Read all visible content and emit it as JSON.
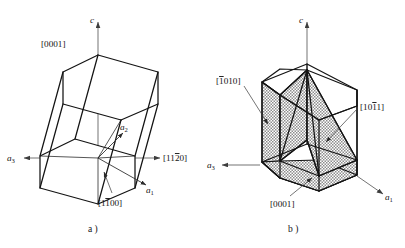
{
  "figure": {
    "background_color": "#ffffff",
    "line_color": "#141414",
    "axis_color": "#5a5a5a",
    "shade_fill": "#b9b9b9"
  },
  "panels": [
    {
      "id": "a",
      "caption": "a )",
      "description": "Hexagonal prism outline with crystallographic axes and direction labels",
      "axes": [
        {
          "name": "c-axis",
          "label": "c",
          "italic": true,
          "arrow": "up"
        },
        {
          "name": "a1-axis",
          "label": "a",
          "subscript": "1",
          "italic": true,
          "arrow": "down-right"
        },
        {
          "name": "a2-axis",
          "label": "a",
          "subscript": "2",
          "italic": true,
          "arrow": "up-right"
        },
        {
          "name": "a3-axis",
          "label": "a",
          "subscript": "3",
          "italic": true,
          "arrow": "right"
        }
      ],
      "direction_labels": [
        {
          "name": "direction-0001",
          "open": "[",
          "digits": "0001",
          "overbars": [],
          "close": "]",
          "text": "[0001]"
        },
        {
          "name": "direction-11-20",
          "open": "[",
          "digits": "1120",
          "overbars": [
            2
          ],
          "close": "]",
          "text": "[1120]"
        },
        {
          "name": "direction-1-100",
          "open": "[",
          "digits": "1100",
          "overbars": [
            1
          ],
          "close": "]",
          "text": "[1100]"
        }
      ]
    },
    {
      "id": "b",
      "caption": "b )",
      "description": "Hexagonal prism with three shaded crystallographic planes",
      "axes": [
        {
          "name": "c-axis",
          "label": "c",
          "italic": true,
          "arrow": "up"
        },
        {
          "name": "a1-axis",
          "label": "a",
          "subscript": "1",
          "italic": true,
          "arrow": "down-right"
        },
        {
          "name": "a3-axis",
          "label": "a",
          "subscript": "3",
          "italic": true,
          "arrow": "left"
        }
      ],
      "plane_labels": [
        {
          "name": "plane-neg1010",
          "open": "[",
          "digits": "1010",
          "overbars": [
            0
          ],
          "close": "]",
          "text": "[1010]"
        },
        {
          "name": "plane-10neg11",
          "open": "[",
          "digits": "1011",
          "overbars": [
            2
          ],
          "close": "]",
          "text": "[1011]"
        },
        {
          "name": "plane-0001",
          "open": "[",
          "digits": "0001",
          "overbars": [],
          "close": "]",
          "text": "[0001]"
        }
      ]
    }
  ]
}
